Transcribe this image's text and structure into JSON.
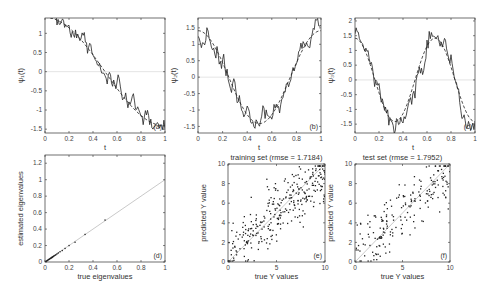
{
  "chart_data": [
    {
      "id": "a",
      "type": "line",
      "panel_label": "(a)",
      "title": "",
      "xlabel": "t",
      "ylabel": "ψ₁(t)",
      "xlim": [
        0,
        1
      ],
      "ylim": [
        -1.6,
        1.4
      ],
      "xticks": [
        "0",
        "0.2",
        "0.4",
        "0.6",
        "0.8",
        "1"
      ],
      "yticks": [
        "-1.5",
        "-1",
        "-0.5",
        "0",
        "0.5",
        "1"
      ],
      "ytick_values": [
        -1.5,
        -1,
        -0.5,
        0,
        0.5,
        1
      ],
      "series": [
        {
          "name": "true (dashed)",
          "style": "dashed",
          "func": "cos",
          "freq": 1,
          "amp": 1.414
        },
        {
          "name": "estimated (solid)",
          "style": "solid",
          "func": "cos",
          "freq": 1,
          "amp": 1.414,
          "noise": 0.12
        }
      ],
      "grid": false
    },
    {
      "id": "b",
      "type": "line",
      "panel_label": "(b)",
      "title": "",
      "xlabel": "",
      "ylabel": "ψ₂(t)",
      "xlim": [
        0,
        1
      ],
      "ylim": [
        -1.7,
        1.8
      ],
      "xticks": [
        "0",
        "0.2",
        "0.4",
        "0.6",
        "0.8",
        "1"
      ],
      "yticks": [
        "-1.5",
        "-1",
        "-0.5",
        "0",
        "0.5",
        "1",
        "1.5"
      ],
      "ytick_values": [
        -1.5,
        -1,
        -0.5,
        0,
        0.5,
        1,
        1.5
      ],
      "series": [
        {
          "name": "true (dashed)",
          "style": "dashed",
          "func": "cos",
          "freq": 2,
          "amp": 1.414
        },
        {
          "name": "estimated (solid)",
          "style": "solid",
          "func": "cos",
          "freq": 2,
          "amp": 1.414,
          "noise": 0.15
        }
      ],
      "grid": false
    },
    {
      "id": "c",
      "type": "line",
      "panel_label": "(c)",
      "title": "",
      "xlabel": "",
      "ylabel": "ψ₃(t)",
      "xlim": [
        0,
        1
      ],
      "ylim": [
        -1.8,
        2.1
      ],
      "xticks": [
        "0",
        "0.2",
        "0.4",
        "0.6",
        "0.8",
        "1"
      ],
      "yticks": [
        "-1.5",
        "-1",
        "-0.5",
        "0",
        "0.5",
        "1",
        "1.5",
        "2"
      ],
      "ytick_values": [
        -1.5,
        -1,
        -0.5,
        0,
        0.5,
        1,
        1.5,
        2
      ],
      "series": [
        {
          "name": "true (dashed)",
          "style": "dashed",
          "func": "sin",
          "freq": 3,
          "amp": 1.414
        },
        {
          "name": "estimated (solid)",
          "style": "solid",
          "func": "sin",
          "freq": 3,
          "amp": 1.414,
          "noise": 0.2
        }
      ],
      "grid": false
    },
    {
      "id": "d",
      "type": "scatter",
      "panel_label": "(d)",
      "title": "",
      "xlabel": "true eigenvalues",
      "ylabel": "estimated eigenvalues",
      "xlim": [
        0,
        1
      ],
      "ylim": [
        0,
        1.3
      ],
      "xticks": [
        "0",
        "0.2",
        "0.4",
        "0.6",
        "0.8",
        "1"
      ],
      "yticks": [
        "0",
        "0.2",
        "0.4",
        "0.6",
        "0.8",
        "1",
        "1.2"
      ],
      "ytick_values": [
        0,
        0.2,
        0.4,
        0.6,
        0.8,
        1,
        1.2
      ],
      "reference_line": "y = x",
      "points": [
        [
          0.5,
          0.51
        ],
        [
          0.333,
          0.335
        ],
        [
          0.25,
          0.24
        ],
        [
          0.2,
          0.2
        ],
        [
          0.167,
          0.165
        ],
        [
          0.143,
          0.14
        ],
        [
          0.125,
          0.125
        ],
        [
          0.111,
          0.11
        ],
        [
          0.1,
          0.1
        ],
        [
          0.091,
          0.09
        ],
        [
          0.083,
          0.082
        ],
        [
          0.077,
          0.076
        ],
        [
          0.071,
          0.07
        ],
        [
          0.067,
          0.066
        ],
        [
          0.062,
          0.061
        ],
        [
          0.059,
          0.058
        ],
        [
          0.056,
          0.055
        ],
        [
          0.053,
          0.052
        ],
        [
          0.05,
          0.05
        ],
        [
          0.045,
          0.044
        ],
        [
          0.04,
          0.04
        ],
        [
          0.035,
          0.034
        ],
        [
          0.03,
          0.03
        ],
        [
          0.025,
          0.025
        ],
        [
          0.02,
          0.02
        ],
        [
          0.015,
          0.015
        ],
        [
          0.01,
          0.01
        ],
        [
          0.005,
          0.005
        ]
      ],
      "grid": false
    },
    {
      "id": "e",
      "type": "scatter",
      "panel_label": "(e)",
      "title": "training set (rmse = 1.7184)",
      "xlabel": "true Y values",
      "ylabel": "predicted Y value",
      "xlim": [
        0,
        10
      ],
      "ylim": [
        0,
        10
      ],
      "xticks": [
        "0",
        "5",
        "10"
      ],
      "xtick_values": [
        0,
        5,
        10
      ],
      "yticks": [
        "0",
        "2",
        "4",
        "6",
        "8",
        "10"
      ],
      "ytick_values": [
        0,
        2,
        4,
        6,
        8,
        10
      ],
      "reference_line": "y = x",
      "rmse": 1.7184,
      "n_points": 300,
      "seed": 7,
      "grid": false
    },
    {
      "id": "f",
      "type": "scatter",
      "panel_label": "(f)",
      "title": "test set (rmse = 1.7952)",
      "xlabel": "true Y values",
      "ylabel": "predicted Y value",
      "xlim": [
        0,
        10
      ],
      "ylim": [
        0,
        10
      ],
      "xticks": [
        "0",
        "5",
        "10"
      ],
      "xtick_values": [
        0,
        5,
        10
      ],
      "yticks": [
        "0",
        "2",
        "4",
        "6",
        "8",
        "10"
      ],
      "ytick_values": [
        0,
        2,
        4,
        6,
        8,
        10
      ],
      "reference_line": "y = x",
      "rmse": 1.7952,
      "n_points": 200,
      "seed": 13,
      "grid": false
    }
  ],
  "colors": {
    "axis": "#333333",
    "data": "#222222",
    "reference": "#bbbbbb",
    "zero_line": "#dddddd"
  }
}
